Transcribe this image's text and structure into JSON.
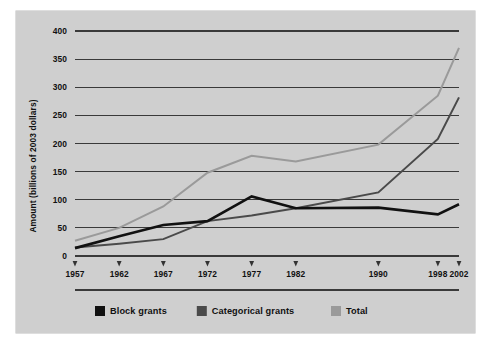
{
  "chart_data": {
    "type": "line",
    "title": "",
    "xlabel": "",
    "ylabel": "Amount (billions of 2003 dollars)",
    "x": [
      "1957",
      "1962",
      "1967",
      "1972",
      "1977",
      "1982",
      "1990",
      "1998",
      "2002"
    ],
    "categories": [
      "1957",
      "1962",
      "1967",
      "1972",
      "1977",
      "1982",
      "1990",
      "1998",
      "2002"
    ],
    "xtick_labels": [
      "1957",
      "1962",
      "1967",
      "1972",
      "1977",
      "1982",
      "1990",
      "1998",
      "2002"
    ],
    "ytick_labels": [
      "0",
      "50",
      "100",
      "150",
      "200",
      "250",
      "300",
      "350",
      "400"
    ],
    "yticks": [
      0,
      50,
      100,
      150,
      200,
      250,
      300,
      350,
      400
    ],
    "ylim": [
      0,
      400
    ],
    "grid": "horizontal",
    "legend_position": "bottom-left",
    "series": [
      {
        "name": "Block grants",
        "color": "#111111",
        "values": [
          14,
          35,
          55,
          62,
          106,
          85,
          86,
          74,
          92
        ]
      },
      {
        "name": "Categorical grants",
        "color": "#4a4a4a",
        "values": [
          15,
          22,
          30,
          62,
          72,
          85,
          113,
          208,
          282
        ]
      },
      {
        "name": "Total",
        "color": "#9a9a9a",
        "values": [
          27,
          50,
          88,
          148,
          178,
          168,
          198,
          285,
          370
        ]
      }
    ]
  },
  "legend": {
    "items": [
      {
        "label": "Block grants",
        "color": "#111111"
      },
      {
        "label": "Categorical grants",
        "color": "#4a4a4a"
      },
      {
        "label": "Total",
        "color": "#9a9a9a"
      }
    ]
  },
  "axis": {
    "y_title": "Amount (billions of 2003 dollars)"
  },
  "colors": {
    "panel_background": "#cfcfcf",
    "figure_background": "#ffffff",
    "gridline": "#3a3a3a",
    "text": "#111111"
  }
}
